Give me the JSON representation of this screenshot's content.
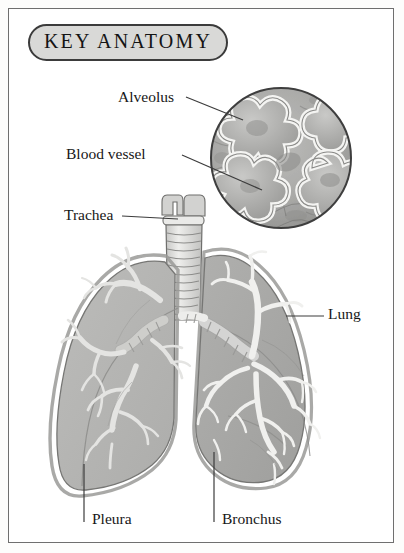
{
  "page": {
    "title": "KEY ANATOMY",
    "background_color": "#ffffff",
    "border_color": "#6f6f6f"
  },
  "badge": {
    "label": "KEY ANATOMY",
    "fill_color": "#d9d9d7",
    "stroke_color": "#3b3b3b"
  },
  "labels": {
    "alveolus": "Alveolus",
    "blood_vessel": "Blood vessel",
    "trachea": "Trachea",
    "lung": "Lung",
    "pleura": "Pleura",
    "bronchus": "Bronchus"
  },
  "colors": {
    "lung_left_fill": "#b6b6b4",
    "lung_right_fill": "#a9a9a7",
    "airway_fill": "#e8e8e6",
    "tissue_fill": "#a2a2a0",
    "outline": "#5e5e5e",
    "leader_line": "#3c3c3c",
    "text": "#171717"
  },
  "figure": {
    "type": "anatomical-illustration",
    "inset": {
      "name": "alveolus-magnification",
      "shape": "circle",
      "center_x": 281,
      "center_y": 158,
      "radius": 70
    },
    "parts": [
      "trachea",
      "left lung",
      "right lung",
      "bronchus",
      "bronchial tree",
      "pleura",
      "alveolus",
      "blood vessel"
    ]
  }
}
